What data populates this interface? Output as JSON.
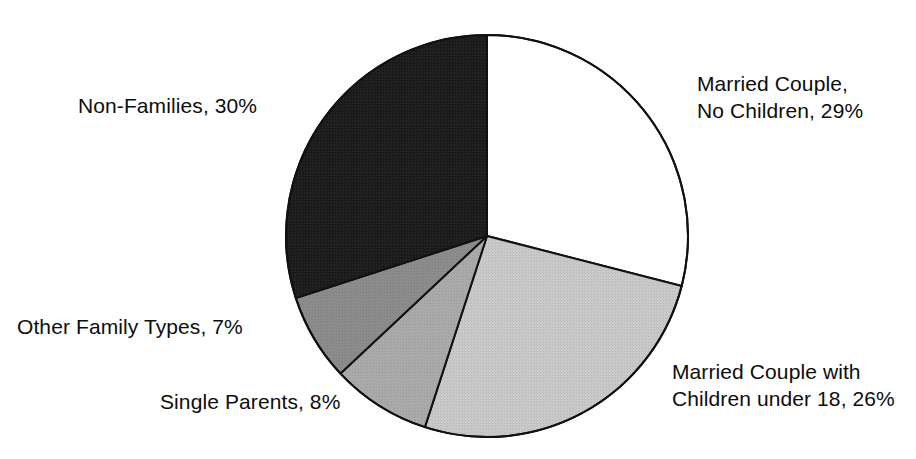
{
  "chart_data": {
    "type": "pie",
    "title": "",
    "subtitle": "",
    "xlabel": "",
    "ylabel": "",
    "legend_position": "none",
    "grid": false,
    "units": "percent",
    "start_angle_deg": 0,
    "direction": "clockwise",
    "total": 100,
    "categories": [
      "Married Couple, No Children",
      "Married Couple with Children under 18",
      "Single Parents",
      "Other Family Types",
      "Non-Families"
    ],
    "values": [
      29,
      26,
      8,
      7,
      30
    ],
    "slices": [
      {
        "name": "Married Couple, No Children",
        "value": 29,
        "value_text": "29%",
        "fill": "#ffffff",
        "stroke": "#111111",
        "label_lines": [
          "Married Couple,",
          "No Children, 29%"
        ]
      },
      {
        "name": "Married Couple with Children under 18",
        "value": 26,
        "value_text": "26%",
        "fill": "#c5c5c5",
        "stroke": "#111111",
        "label_lines": [
          "Married Couple with",
          "Children under 18, 26%"
        ]
      },
      {
        "name": "Single Parents",
        "value": 8,
        "value_text": "8%",
        "fill": "#a9a9a9",
        "stroke": "#111111",
        "label_lines": [
          "Single Parents, 8%"
        ]
      },
      {
        "name": "Other Family Types",
        "value": 7,
        "value_text": "7%",
        "fill": "#8b8b8b",
        "stroke": "#111111",
        "label_lines": [
          "Other Family Types, 7%"
        ]
      },
      {
        "name": "Non-Families",
        "value": 30,
        "value_text": "30%",
        "fill": "#1c1c1c",
        "stroke": "#111111",
        "label_lines": [
          "Non-Families, 30%"
        ]
      }
    ]
  },
  "labels": {
    "married_no_children": {
      "line1": "Married Couple,",
      "line2": "No Children, 29%"
    },
    "married_with_children": {
      "line1": "Married Couple with",
      "line2": "Children under 18, 26%"
    },
    "single_parents": {
      "line1": "Single Parents, 8%"
    },
    "other_family_types": {
      "line1": "Other Family Types, 7%"
    },
    "non_families": {
      "line1": "Non-Families, 30%"
    }
  },
  "geometry": {
    "cx": 487,
    "cy": 236,
    "r": 201
  },
  "colors": {
    "outline": "#111111",
    "text": "#0d0d0d",
    "background": "#ffffff"
  }
}
